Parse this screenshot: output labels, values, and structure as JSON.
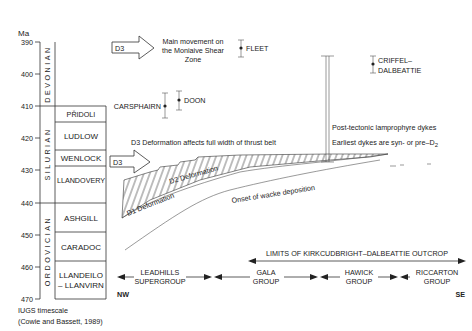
{
  "axis": {
    "unit_label": "Ma",
    "ticks": [
      "390",
      "400",
      "410",
      "420",
      "430",
      "440",
      "450",
      "460",
      "470"
    ]
  },
  "periods": [
    {
      "name": "DEVONIAN"
    },
    {
      "name": "SILURIAN"
    },
    {
      "name": "ORDOVICIAN"
    }
  ],
  "series": [
    {
      "name": "PŘIDOLI"
    },
    {
      "name": "LUDLOW"
    },
    {
      "name": "WENLOCK"
    },
    {
      "name": "LLANDOVERY"
    },
    {
      "name": "ASHGILL"
    },
    {
      "name": "CARADOC"
    },
    {
      "name": "LLANDEILO",
      "name2": "– LLANVIRN"
    }
  ],
  "timescale_note": {
    "line1": "IUGS timescale",
    "line2": "(Cowie and Bassett, 1989)"
  },
  "events": {
    "d3_top_arrow": "D3",
    "d3_top_text": [
      "Main movement on",
      "the Moniaive Shear",
      "Zone"
    ],
    "d3_mid_arrow": "D3",
    "d3_mid_text": "D3  Deformation affects full width of thrust belt",
    "d2_label": "D2 Deformation",
    "d1_label": "D1 Deformation",
    "wacke_label": "Onset of wacke deposition",
    "dykes_line1": "Post-tectonic lamprophyre dykes",
    "dykes_line2": "Earliest dykes are syn- or pre–D",
    "dykes_sub": "2"
  },
  "intrusions": [
    {
      "name": "FLEET"
    },
    {
      "name": "CARSPHAIRN"
    },
    {
      "name": "DOON"
    },
    {
      "name": "CRIFFEL–",
      "name2": "DALBEATTIE"
    }
  ],
  "outcrop_limits": "LIMITS OF KIRKCUDBRIGHT–DALBEATTIE OUTCROP",
  "groups": [
    {
      "line1": "LEADHILLS",
      "line2": "SUPERGROUP"
    },
    {
      "line1": "GALA",
      "line2": "GROUP"
    },
    {
      "line1": "HAWICK",
      "line2": "GROUP"
    },
    {
      "line1": "RICCARTON",
      "line2": "GROUP"
    }
  ],
  "directions": {
    "left": "NW",
    "right": "SE"
  }
}
